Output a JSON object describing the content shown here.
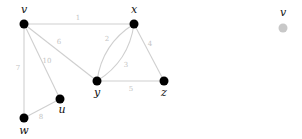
{
  "diagram": {
    "type": "weighted-undirected-graph",
    "colors": {
      "node": "#000000",
      "edge": "#cfcfcf",
      "edge_label": "#c4c4c4",
      "legend_node": "#c8c8c8"
    },
    "nodes": [
      {
        "id": "v",
        "label": "v",
        "x": 24,
        "y": 24,
        "lx": 24,
        "ly": 13
      },
      {
        "id": "x",
        "label": "x",
        "x": 134,
        "y": 24,
        "lx": 134,
        "ly": 13
      },
      {
        "id": "y",
        "label": "y",
        "x": 97,
        "y": 81,
        "lx": 97,
        "ly": 96
      },
      {
        "id": "z",
        "label": "z",
        "x": 164,
        "y": 81,
        "lx": 164,
        "ly": 96
      },
      {
        "id": "u",
        "label": "u",
        "x": 60,
        "y": 99,
        "lx": 62,
        "ly": 113
      },
      {
        "id": "w",
        "label": "w",
        "x": 24,
        "y": 118,
        "lx": 24,
        "ly": 134
      }
    ],
    "edges": [
      {
        "from": "v",
        "to": "x",
        "weight": "1",
        "lx": 78,
        "ly": 20
      },
      {
        "from": "v",
        "to": "y",
        "weight": "6",
        "lx": 59,
        "ly": 44
      },
      {
        "from": "v",
        "to": "u",
        "weight": "10",
        "lx": 47,
        "ly": 63
      },
      {
        "from": "v",
        "to": "w",
        "weight": "7",
        "lx": 18,
        "ly": 70
      },
      {
        "from": "w",
        "to": "u",
        "weight": "8",
        "lx": 41,
        "ly": 119
      },
      {
        "from": "x",
        "to": "y",
        "weight": "2",
        "curve": "left",
        "lx": 107,
        "ly": 41
      },
      {
        "from": "x",
        "to": "y",
        "weight": "3",
        "curve": "right",
        "lx": 126,
        "ly": 67
      },
      {
        "from": "x",
        "to": "z",
        "weight": "4",
        "lx": 150,
        "ly": 46
      },
      {
        "from": "y",
        "to": "z",
        "weight": "5",
        "lx": 131,
        "ly": 91
      }
    ],
    "legend": {
      "label": "v",
      "x": 283,
      "y": 28,
      "lx": 283,
      "ly": 16
    }
  }
}
